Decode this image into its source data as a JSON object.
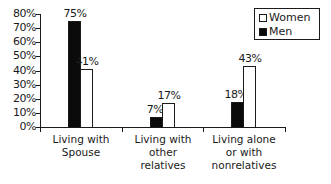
{
  "chart_data": {
    "type": "bar",
    "title": "",
    "xlabel": "",
    "ylabel": "",
    "ylim": [
      0,
      80
    ],
    "yticks": [
      "0%",
      "10%",
      "20%",
      "30%",
      "40%",
      "50%",
      "60%",
      "70%",
      "80%"
    ],
    "categories": [
      "Living with Spouse",
      "Living with other relatives",
      "Living alone or with nonrelatives"
    ],
    "category_lines": [
      [
        "Living with",
        "Spouse"
      ],
      [
        "Living with",
        "other",
        "relatives"
      ],
      [
        "Living alone",
        "or with",
        "nonrelatives"
      ]
    ],
    "series": [
      {
        "name": "Men",
        "color": "#0a0a0a",
        "values": [
          75,
          7,
          18
        ],
        "labels": [
          "75%",
          "7%",
          "18%"
        ]
      },
      {
        "name": "Women",
        "color": "#ffffff",
        "values": [
          41,
          17,
          43
        ],
        "labels": [
          "41%",
          "17%",
          "43%"
        ]
      }
    ],
    "legend": {
      "position": "top-right",
      "entries": [
        "Women",
        "Men"
      ]
    },
    "grid": false
  }
}
